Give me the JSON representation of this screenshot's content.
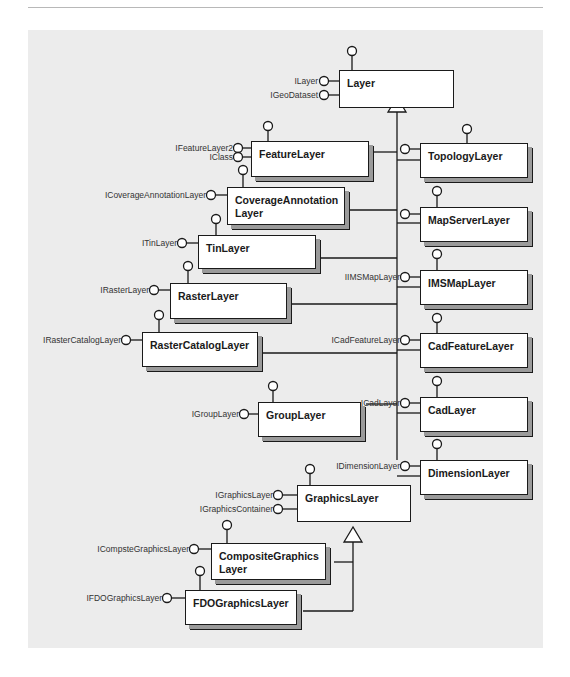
{
  "diagram": {
    "type": "uml-class-inheritance",
    "root": "Layer",
    "classes": [
      {
        "id": "layer",
        "name": "Layer",
        "interfaces": [
          "ILayer",
          "IGeoDataset"
        ],
        "abstract": true
      },
      {
        "id": "featurelayer",
        "name": "FeatureLayer",
        "interfaces": [
          "IFeatureLayer2",
          "IClass"
        ]
      },
      {
        "id": "covanno",
        "name": "CoverageAnnotation\nLayer",
        "interfaces": [
          "ICoverageAnnotationLayer"
        ]
      },
      {
        "id": "tin",
        "name": "TinLayer",
        "interfaces": [
          "ITinLayer"
        ]
      },
      {
        "id": "raster",
        "name": "RasterLayer",
        "interfaces": [
          "IRasterLayer"
        ]
      },
      {
        "id": "rastercat",
        "name": "RasterCatalogLayer",
        "interfaces": [
          "IRasterCatalogLayer"
        ]
      },
      {
        "id": "group",
        "name": "GroupLayer",
        "interfaces": [
          "IGroupLayer"
        ]
      },
      {
        "id": "graphics",
        "name": "GraphicsLayer",
        "interfaces": [
          "IGraphicsLayer",
          "IGraphicsContainer"
        ],
        "abstract": true
      },
      {
        "id": "composite",
        "name": "CompositeGraphics\nLayer",
        "interfaces": [
          "ICompsteGraphicsLayer"
        ]
      },
      {
        "id": "fdo",
        "name": "FDOGraphicsLayer",
        "interfaces": [
          "IFDOGraphicsLayer"
        ]
      },
      {
        "id": "topology",
        "name": "TopologyLayer",
        "interfaces": []
      },
      {
        "id": "mapserver",
        "name": "MapServerLayer",
        "interfaces": []
      },
      {
        "id": "imsmap",
        "name": "IMSMapLayer",
        "interfaces": [
          "IIMSMapLayer"
        ]
      },
      {
        "id": "cadfeature",
        "name": "CadFeatureLayer",
        "interfaces": [
          "ICadFeatureLayer"
        ]
      },
      {
        "id": "cad",
        "name": "CadLayer",
        "interfaces": [
          "ICadLayer"
        ]
      },
      {
        "id": "dimension",
        "name": "DimensionLayer",
        "interfaces": [
          "IDimensionLayer"
        ]
      }
    ]
  },
  "labels": {
    "layer": "Layer",
    "ilayer": "ILayer",
    "igeodataset": "IGeoDataset",
    "featurelayer": "FeatureLayer",
    "ifeaturelayer2": "IFeatureLayer2",
    "iclass": "IClass",
    "covanno": "CoverageAnnotation\nLayer",
    "icovanno": "ICoverageAnnotationLayer",
    "tin": "TinLayer",
    "itin": "ITinLayer",
    "raster": "RasterLayer",
    "iraster": "IRasterLayer",
    "rastercat": "RasterCatalogLayer",
    "irastercat": "IRasterCatalogLayer",
    "group": "GroupLayer",
    "igroup": "IGroupLayer",
    "graphics": "GraphicsLayer",
    "igraphicslayer": "IGraphicsLayer",
    "igraphicscontainer": "IGraphicsContainer",
    "composite": "CompositeGraphics\nLayer",
    "icomposite": "ICompsteGraphicsLayer",
    "fdo": "FDOGraphicsLayer",
    "ifdo": "IFDOGraphicsLayer",
    "topology": "TopologyLayer",
    "mapserver": "MapServerLayer",
    "imsmap": "IMSMapLayer",
    "iimsmap": "IIMSMapLayer",
    "cadfeature": "CadFeatureLayer",
    "icadfeature": "ICadFeatureLayer",
    "cad": "CadLayer",
    "icad": "ICadLayer",
    "dimension": "DimensionLayer",
    "idimension": "IDimensionLayer"
  },
  "colors": {
    "background": "#ececec",
    "box_fill": "#ffffff",
    "line": "#1a1a1a",
    "shadow": "#9a9a9a"
  }
}
